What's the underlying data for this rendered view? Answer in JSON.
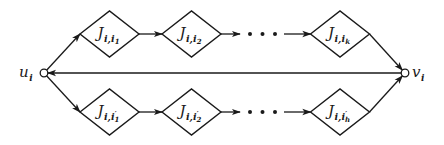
{
  "diagram": {
    "type": "directed-graph",
    "source_node": {
      "id": "u",
      "label": "u",
      "subscript": "i"
    },
    "sink_node": {
      "id": "v",
      "label": "v",
      "subscript": "i"
    },
    "top_path": {
      "nodes": [
        {
          "label": "J",
          "subscript": "i,i",
          "subsub": "1",
          "prime": false
        },
        {
          "label": "J",
          "subscript": "i,i",
          "subsub": "2",
          "prime": false
        },
        {
          "label": "J",
          "subscript": "i,i",
          "subsub": "k",
          "prime": false
        }
      ],
      "ellipsis": "• • •"
    },
    "bottom_path": {
      "nodes": [
        {
          "label": "J",
          "subscript": "i,i",
          "subsub": "1",
          "prime": true
        },
        {
          "label": "J",
          "subscript": "i,i",
          "subsub": "2",
          "prime": true
        },
        {
          "label": "J",
          "subscript": "i,i",
          "subsub": "h",
          "prime": true
        }
      ],
      "ellipsis": "• • •"
    },
    "edges": [
      {
        "from": "u",
        "to": "top.0"
      },
      {
        "from": "top.0",
        "to": "top.1"
      },
      {
        "from": "top.1",
        "to": "top.ellipsis"
      },
      {
        "from": "top.ellipsis",
        "to": "top.2"
      },
      {
        "from": "top.2",
        "to": "v"
      },
      {
        "from": "v",
        "to": "u"
      },
      {
        "from": "u",
        "to": "bottom.0"
      },
      {
        "from": "bottom.0",
        "to": "bottom.1"
      },
      {
        "from": "bottom.1",
        "to": "bottom.ellipsis"
      },
      {
        "from": "bottom.ellipsis",
        "to": "bottom.2"
      },
      {
        "from": "bottom.2",
        "to": "v"
      }
    ],
    "colors": {
      "stroke": "#1a1a1a",
      "background": "#ffffff"
    }
  }
}
